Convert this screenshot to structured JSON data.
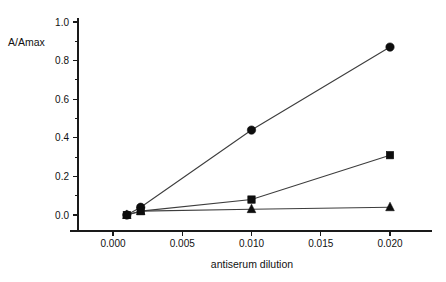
{
  "chart_data": {
    "type": "line",
    "title": "",
    "subtitle": "",
    "xlabel": "antiserum dilution",
    "ylabel": "A/Amax",
    "xlim": [
      -0.0005,
      0.0215
    ],
    "ylim": [
      0.0,
      1.0
    ],
    "grid": false,
    "legend": null,
    "legend_position": "none",
    "x_ticks": [
      0.0,
      0.005,
      0.01,
      0.015,
      0.02
    ],
    "x_tick_labels": [
      "0.000",
      "0.005",
      "0.010",
      "0.015",
      "0.020"
    ],
    "y_ticks": [
      0.0,
      0.2,
      0.4,
      0.6,
      0.8,
      1.0
    ],
    "y_tick_labels": [
      "0.0",
      "0.2",
      "0.4",
      "0.6",
      "0.8",
      "1.0"
    ],
    "y_minor_ticks": [
      0.1,
      0.3,
      0.5,
      0.7,
      0.9
    ],
    "series": [
      {
        "name": "series-circle",
        "marker": "circle",
        "x": [
          0.001,
          0.002,
          0.01,
          0.02
        ],
        "values": [
          0.0,
          0.04,
          0.44,
          0.87
        ]
      },
      {
        "name": "series-square",
        "marker": "square",
        "x": [
          0.001,
          0.002,
          0.01,
          0.02
        ],
        "values": [
          0.0,
          0.02,
          0.08,
          0.31
        ]
      },
      {
        "name": "series-triangle",
        "marker": "triangle",
        "x": [
          0.001,
          0.002,
          0.01,
          0.02
        ],
        "values": [
          0.0,
          0.02,
          0.03,
          0.04
        ]
      }
    ],
    "colors": {
      "marker": "#0d0d0d",
      "line": "#3d3d3d",
      "axis": "#1a1a1a",
      "background": "#ffffff"
    }
  }
}
